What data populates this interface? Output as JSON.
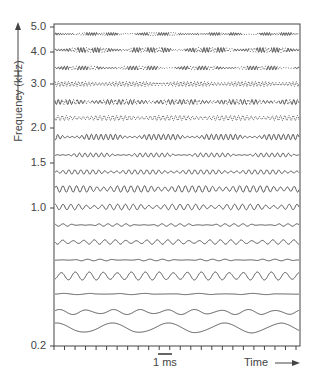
{
  "figure": {
    "y_axis_title": "Frequency (kHz)",
    "x_axis_title": "Time",
    "scale_bar_label": "1 ms",
    "y_ticks": [
      {
        "label": "5.0",
        "y": 27
      },
      {
        "label": "4.0",
        "y": 52
      },
      {
        "label": "3.0",
        "y": 84
      },
      {
        "label": "2.0",
        "y": 128
      },
      {
        "label": "1.5",
        "y": 163
      },
      {
        "label": "1.0",
        "y": 208
      },
      {
        "label": "0.2",
        "y": 346
      }
    ],
    "trace_color": "#555555",
    "axis_color": "#444444"
  },
  "chart_data": {
    "type": "line",
    "title": "",
    "xlabel": "Time",
    "ylabel": "Frequency (kHz)",
    "y_scale": "log",
    "ylim": [
      0.2,
      5.0
    ],
    "y_tick_labels": [
      "5.0",
      "4.0",
      "3.0",
      "2.0",
      "1.5",
      "1.0",
      "0.2"
    ],
    "x_scale_bar": "1 ms",
    "x_minor_ticks": 23,
    "grid": false,
    "legend": null,
    "series_description": "Stacked waveform traces (filter-bank outputs), one per frequency channel; higher channels drawn dotted, lower channels solid; amplitude varies over time",
    "traces": [
      {
        "y": 34,
        "period": 2.4,
        "amp": 1.5,
        "style": "dotted-mixed",
        "env": 0.18
      },
      {
        "y": 50,
        "period": 2.8,
        "amp": 2.5,
        "style": "dotted-mixed",
        "env": 0.16
      },
      {
        "y": 68,
        "period": 3.0,
        "amp": 2.0,
        "style": "dotted-mixed",
        "env": 0.2
      },
      {
        "y": 84,
        "period": 3.4,
        "amp": 2.5,
        "style": "dotted",
        "env": 0.1
      },
      {
        "y": 102,
        "period": 3.8,
        "amp": 2.5,
        "style": "solid-dotted",
        "env": 0.12
      },
      {
        "y": 118,
        "period": 4.2,
        "amp": 2.5,
        "style": "dotted",
        "env": 0.1
      },
      {
        "y": 137,
        "period": 4.8,
        "amp": 2.8,
        "style": "solid",
        "env": 0.2
      },
      {
        "y": 155,
        "period": 5.5,
        "amp": 2.0,
        "style": "solid",
        "env": 0.25
      },
      {
        "y": 172,
        "period": 6.0,
        "amp": 2.2,
        "style": "solid",
        "env": 0.15
      },
      {
        "y": 189,
        "period": 6.8,
        "amp": 3.2,
        "style": "solid",
        "env": 0.1
      },
      {
        "y": 207,
        "period": 7.8,
        "amp": 2.8,
        "style": "solid",
        "env": 0.12
      },
      {
        "y": 225,
        "period": 9.0,
        "amp": 1.2,
        "style": "solid",
        "env": 0.3
      },
      {
        "y": 242,
        "period": 10.5,
        "amp": 2.2,
        "style": "solid",
        "env": 0.1
      },
      {
        "y": 260,
        "period": 12.5,
        "amp": 0.8,
        "style": "solid",
        "env": 0.3
      },
      {
        "y": 276,
        "period": 14.0,
        "amp": 4.0,
        "style": "solid",
        "env": 0.05
      },
      {
        "y": 294,
        "period": 27.0,
        "amp": 0.6,
        "style": "solid",
        "env": 0.3
      },
      {
        "y": 312,
        "period": 27.0,
        "amp": 2.5,
        "style": "solid",
        "env": 0.1
      },
      {
        "y": 328,
        "period": 56.0,
        "amp": 5.0,
        "style": "solid",
        "env": 0.05
      }
    ]
  }
}
